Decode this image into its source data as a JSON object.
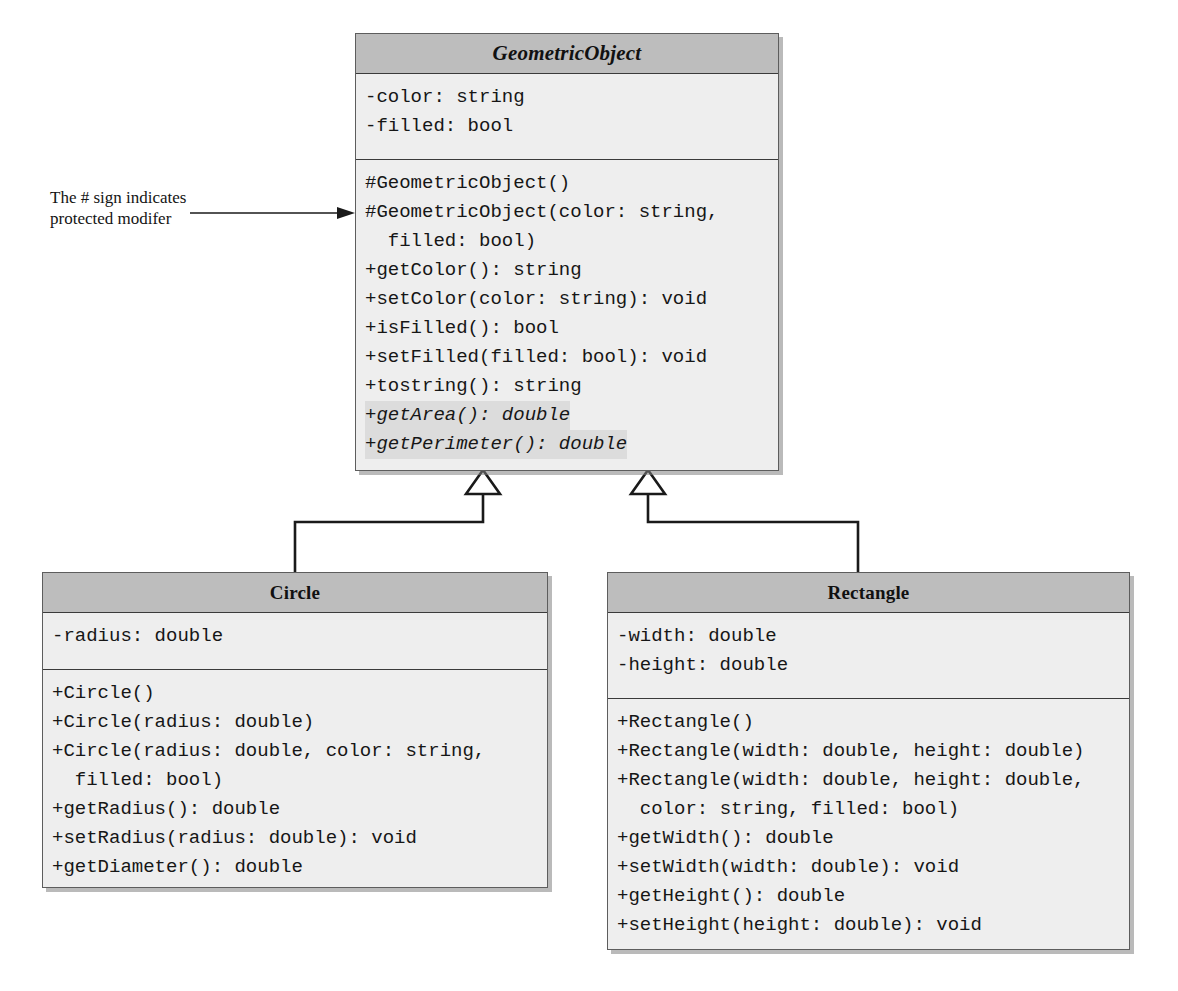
{
  "diagram": {
    "type": "uml-class-diagram",
    "annotation": {
      "line1": "The # sign indicates",
      "line2": "protected modifer"
    },
    "classes": [
      {
        "id": "geometric-object",
        "name": "GeometricObject",
        "abstract": true,
        "title_style": "bold-italic-serif",
        "attributes": [
          "-color: string",
          "-filled: bool"
        ],
        "methods": [
          {
            "text": "#GeometricObject()",
            "abstract": false
          },
          {
            "text": "#GeometricObject(color: string,\n  filled: bool)",
            "abstract": false
          },
          {
            "text": "+getColor(): string",
            "abstract": false
          },
          {
            "text": "+setColor(color: string): void",
            "abstract": false
          },
          {
            "text": "+isFilled(): bool",
            "abstract": false
          },
          {
            "text": "+setFilled(filled: bool): void",
            "abstract": false
          },
          {
            "text": "+tostring(): string",
            "abstract": false
          },
          {
            "text": "+getArea(): double",
            "abstract": true
          },
          {
            "text": "+getPerimeter(): double",
            "abstract": true
          }
        ]
      },
      {
        "id": "circle",
        "name": "Circle",
        "abstract": false,
        "title_style": "bold-serif",
        "attributes": [
          "-radius: double"
        ],
        "methods": [
          {
            "text": "+Circle()",
            "abstract": false
          },
          {
            "text": "+Circle(radius: double)",
            "abstract": false
          },
          {
            "text": "+Circle(radius: double, color: string,\n  filled: bool)",
            "abstract": false
          },
          {
            "text": "+getRadius(): double",
            "abstract": false
          },
          {
            "text": "+setRadius(radius: double): void",
            "abstract": false
          },
          {
            "text": "+getDiameter(): double",
            "abstract": false
          }
        ]
      },
      {
        "id": "rectangle",
        "name": "Rectangle",
        "abstract": false,
        "title_style": "bold-serif",
        "attributes": [
          "-width: double",
          "-height: double"
        ],
        "methods": [
          {
            "text": "+Rectangle()",
            "abstract": false
          },
          {
            "text": "+Rectangle(width: double, height: double)",
            "abstract": false
          },
          {
            "text": "+Rectangle(width: double, height: double,\n  color: string, filled: bool)",
            "abstract": false
          },
          {
            "text": "+getWidth(): double",
            "abstract": false
          },
          {
            "text": "+setWidth(width: double): void",
            "abstract": false
          },
          {
            "text": "+getHeight(): double",
            "abstract": false
          },
          {
            "text": "+setHeight(height: double): void",
            "abstract": false
          }
        ]
      }
    ],
    "relationships": [
      {
        "from": "circle",
        "to": "geometric-object",
        "kind": "inheritance"
      },
      {
        "from": "rectangle",
        "to": "geometric-object",
        "kind": "inheritance"
      }
    ],
    "colors": {
      "header_fill": "#bdbdbd",
      "body_fill": "#eeeeee",
      "border": "#5d5d5d",
      "abstract_highlight": "#dcdcdc",
      "connector": "#1a1a1a"
    }
  }
}
